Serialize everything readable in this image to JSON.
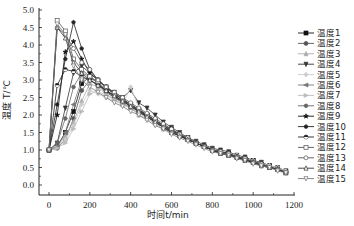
{
  "chart_data": {
    "type": "line",
    "title": "",
    "xlabel": "时间t/min",
    "ylabel": "温度 T/℃",
    "xlim": [
      -50,
      1200
    ],
    "ylim": [
      -0.3,
      5.0
    ],
    "xticks": [
      0,
      200,
      400,
      600,
      800,
      1000,
      1200
    ],
    "yticks": [
      0.0,
      0.5,
      1.0,
      1.5,
      2.0,
      2.5,
      3.0,
      3.5,
      4.0,
      4.5,
      5.0
    ],
    "grid": false,
    "legend_position": "right",
    "x": [
      0,
      40,
      80,
      120,
      160,
      200,
      240,
      280,
      320,
      360,
      400,
      440,
      480,
      520,
      560,
      600,
      640,
      680,
      720,
      760,
      800,
      840,
      880,
      920,
      960,
      1000,
      1040,
      1080,
      1120,
      1160
    ],
    "series": [
      {
        "name": "温度1",
        "marker": "square-filled",
        "color": "#111111",
        "values": [
          1.0,
          1.1,
          1.5,
          2.1,
          2.9,
          3.1,
          2.9,
          2.7,
          2.5,
          2.4,
          2.3,
          2.1,
          2.0,
          1.8,
          1.7,
          1.6,
          1.45,
          1.35,
          1.2,
          1.1,
          1.0,
          0.95,
          0.9,
          0.8,
          0.75,
          0.7,
          0.6,
          0.55,
          0.45,
          0.4
        ]
      },
      {
        "name": "温度2",
        "marker": "circle-filled",
        "color": "#555555",
        "values": [
          1.0,
          1.05,
          1.3,
          1.9,
          2.7,
          3.0,
          2.85,
          2.65,
          2.5,
          2.35,
          2.2,
          2.05,
          1.95,
          1.8,
          1.65,
          1.55,
          1.4,
          1.3,
          1.2,
          1.1,
          1.0,
          0.9,
          0.85,
          0.8,
          0.7,
          0.65,
          0.6,
          0.5,
          0.45,
          0.4
        ]
      },
      {
        "name": "温度3",
        "marker": "triangle-filled",
        "color": "#aaaaaa",
        "values": [
          1.0,
          1.1,
          1.4,
          1.8,
          2.4,
          2.9,
          2.8,
          2.6,
          2.45,
          2.3,
          2.2,
          2.0,
          1.9,
          1.75,
          1.6,
          1.5,
          1.4,
          1.3,
          1.2,
          1.1,
          1.0,
          0.9,
          0.9,
          0.85,
          0.75,
          0.7,
          0.6,
          0.55,
          0.5,
          0.4
        ]
      },
      {
        "name": "温度4",
        "marker": "tri-down-filled",
        "color": "#333333",
        "values": [
          1.0,
          1.2,
          2.2,
          3.2,
          3.4,
          3.2,
          3.0,
          2.8,
          2.65,
          2.5,
          2.7,
          2.35,
          2.2,
          2.0,
          1.8,
          1.65,
          1.5,
          1.35,
          1.25,
          1.15,
          1.05,
          1.0,
          0.95,
          0.85,
          0.8,
          0.7,
          0.65,
          0.55,
          0.5,
          0.4
        ]
      },
      {
        "name": "温度5",
        "marker": "diamond-filled",
        "color": "#cccccc",
        "values": [
          1.0,
          1.1,
          1.3,
          1.7,
          2.3,
          2.7,
          2.6,
          2.5,
          2.4,
          2.3,
          2.8,
          2.2,
          2.0,
          1.85,
          1.7,
          1.55,
          1.45,
          1.35,
          1.2,
          1.1,
          1.0,
          0.95,
          0.9,
          0.85,
          0.75,
          0.7,
          0.6,
          0.55,
          0.5,
          0.4
        ]
      },
      {
        "name": "温度6",
        "marker": "tri-left-filled",
        "color": "#777777",
        "values": [
          1.0,
          1.1,
          1.5,
          2.3,
          3.0,
          3.1,
          2.9,
          2.75,
          2.6,
          2.45,
          2.3,
          2.15,
          2.0,
          1.85,
          1.7,
          1.55,
          1.45,
          1.3,
          1.2,
          1.1,
          1.0,
          0.95,
          0.85,
          0.8,
          0.75,
          0.65,
          0.6,
          0.5,
          0.45,
          0.35
        ]
      },
      {
        "name": "温度7",
        "marker": "tri-right-filled",
        "color": "#bbbbbb",
        "values": [
          1.0,
          1.05,
          1.2,
          1.6,
          2.1,
          2.6,
          2.7,
          2.55,
          2.45,
          2.3,
          2.2,
          2.05,
          1.95,
          1.8,
          1.65,
          1.5,
          1.4,
          1.3,
          1.2,
          1.1,
          1.0,
          0.9,
          0.85,
          0.8,
          0.75,
          0.65,
          0.6,
          0.55,
          0.45,
          0.4
        ]
      },
      {
        "name": "温度8",
        "marker": "hexagon-filled",
        "color": "#666666",
        "values": [
          1.0,
          1.2,
          1.9,
          2.8,
          3.2,
          3.1,
          2.9,
          2.7,
          2.55,
          2.4,
          2.25,
          2.1,
          1.95,
          1.8,
          1.65,
          1.55,
          1.4,
          1.3,
          1.2,
          1.1,
          1.0,
          0.95,
          0.9,
          0.8,
          0.75,
          0.65,
          0.6,
          0.5,
          0.45,
          0.35
        ]
      },
      {
        "name": "温度9",
        "marker": "star-filled",
        "color": "#111111",
        "values": [
          1.0,
          2.0,
          3.8,
          4.1,
          3.6,
          3.2,
          3.0,
          2.8,
          2.6,
          2.45,
          2.3,
          2.15,
          2.0,
          1.85,
          1.7,
          1.55,
          1.45,
          1.3,
          1.2,
          1.1,
          1.0,
          0.95,
          0.9,
          0.8,
          0.75,
          0.65,
          0.6,
          0.5,
          0.45,
          0.35
        ]
      },
      {
        "name": "温度10",
        "marker": "pentagon-filled",
        "color": "#222222",
        "values": [
          1.0,
          2.3,
          3.6,
          4.65,
          3.9,
          3.3,
          3.0,
          2.8,
          2.6,
          2.45,
          2.3,
          2.15,
          2.0,
          1.85,
          1.7,
          1.55,
          1.45,
          1.3,
          1.2,
          1.1,
          1.0,
          0.95,
          0.9,
          0.8,
          0.75,
          0.65,
          0.6,
          0.5,
          0.45,
          0.35
        ]
      },
      {
        "name": "温度11",
        "marker": "circle-half",
        "color": "#222222",
        "values": [
          1.0,
          2.85,
          3.3,
          3.25,
          3.1,
          3.0,
          2.85,
          2.7,
          2.55,
          2.4,
          2.25,
          2.1,
          1.95,
          1.8,
          1.65,
          1.5,
          1.4,
          1.3,
          1.2,
          1.1,
          1.0,
          0.9,
          0.85,
          0.8,
          0.7,
          0.65,
          0.55,
          0.5,
          0.45,
          0.35
        ]
      },
      {
        "name": "温度12",
        "marker": "square-open",
        "color": "#555555",
        "values": [
          1.0,
          4.7,
          4.4,
          3.6,
          3.3,
          3.1,
          2.95,
          2.8,
          2.6,
          2.45,
          2.3,
          2.15,
          2.0,
          1.85,
          1.7,
          1.55,
          1.45,
          1.3,
          1.2,
          1.1,
          1.0,
          0.95,
          0.85,
          0.8,
          0.75,
          0.65,
          0.6,
          0.5,
          0.45,
          0.35
        ]
      },
      {
        "name": "温度13",
        "marker": "circle-open",
        "color": "#555555",
        "values": [
          1.0,
          4.5,
          4.3,
          3.9,
          3.5,
          3.3,
          3.0,
          2.8,
          2.65,
          2.5,
          2.35,
          2.2,
          2.05,
          1.9,
          1.75,
          1.6,
          1.45,
          1.35,
          1.2,
          1.1,
          1.0,
          0.95,
          0.9,
          0.8,
          0.75,
          0.65,
          0.6,
          0.5,
          0.45,
          0.35
        ]
      },
      {
        "name": "温度14",
        "marker": "triangle-open",
        "color": "#333333",
        "values": [
          1.0,
          4.5,
          4.2,
          3.5,
          3.2,
          3.0,
          2.85,
          2.7,
          2.55,
          2.4,
          2.25,
          2.1,
          1.95,
          1.8,
          1.65,
          1.5,
          1.4,
          1.3,
          1.2,
          1.1,
          1.0,
          0.9,
          0.85,
          0.8,
          0.7,
          0.65,
          0.55,
          0.5,
          0.45,
          0.35
        ]
      },
      {
        "name": "温度15",
        "marker": "tri-down-open",
        "color": "#777777",
        "values": [
          1.0,
          4.6,
          4.3,
          3.4,
          3.0,
          2.8,
          2.65,
          2.5,
          2.35,
          2.25,
          2.1,
          2.0,
          1.85,
          1.7,
          1.6,
          1.45,
          1.35,
          1.25,
          1.15,
          1.05,
          0.95,
          0.9,
          0.85,
          0.75,
          0.7,
          0.6,
          0.55,
          0.5,
          0.4,
          0.35
        ]
      }
    ]
  }
}
